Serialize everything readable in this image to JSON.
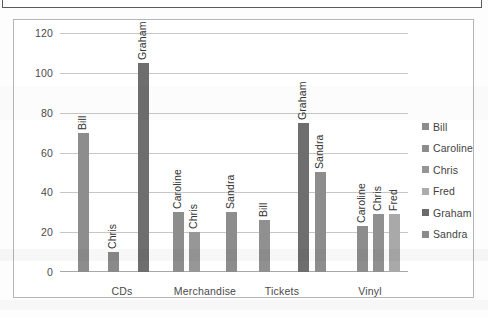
{
  "chart_data": {
    "type": "bar",
    "title": "",
    "subtitle": "",
    "xlabel": "",
    "ylabel": "",
    "ylim": [
      0,
      120
    ],
    "ytick_step": 20,
    "yticks": [
      "120",
      "100",
      "80",
      "60",
      "40",
      "20",
      "0"
    ],
    "grid": true,
    "legend_position": "right",
    "categories": [
      "CDs",
      "Merchandise",
      "Tickets",
      "Vinyl"
    ],
    "legend": [
      "Bill",
      "Caroline",
      "Chris",
      "Fred",
      "Graham",
      "Sandra"
    ],
    "series": [
      {
        "name": "Bill",
        "values": [
          70,
          null,
          null,
          null
        ]
      },
      {
        "name": "Caroline",
        "values": [
          null,
          30,
          null,
          23
        ]
      },
      {
        "name": "Chris",
        "values": [
          10,
          20,
          null,
          29
        ]
      },
      {
        "name": "Fred",
        "values": [
          null,
          null,
          null,
          29
        ]
      },
      {
        "name": "Graham",
        "values": [
          105,
          null,
          75,
          null
        ]
      },
      {
        "name": "Sandra",
        "values": [
          null,
          30,
          50,
          null
        ]
      }
    ],
    "groups": [
      {
        "category": "CDs",
        "bars": [
          {
            "label": "Bill",
            "value": 70,
            "color": "#8d8d8d"
          },
          {
            "label": "Chris",
            "value": 10,
            "color": "#8a8a8a"
          },
          {
            "label": "Graham",
            "value": 105,
            "color": "#707070"
          }
        ]
      },
      {
        "category": "Merchandise",
        "bars": [
          {
            "label": "Caroline",
            "value": 30,
            "color": "#8d8d8d"
          },
          {
            "label": "Chris",
            "value": 20,
            "color": "#989898"
          }
        ]
      },
      {
        "category": "Tickets",
        "bars": [
          {
            "label": "Sandra",
            "value": 26,
            "color": "#8d8d8d"
          },
          {
            "label": "Bill",
            "value": 0,
            "color": "#8d8d8d"
          }
        ]
      },
      {
        "category": "Vinyl",
        "bars": [
          {
            "label": "Caroline",
            "value": 23,
            "color": "#8d8d8d"
          },
          {
            "label": "Chris",
            "value": 29,
            "color": "#909090"
          },
          {
            "label": "Fred",
            "value": 29,
            "color": "#a8a8a8"
          }
        ]
      }
    ],
    "plotted_bars": [
      {
        "label": "Bill",
        "value": 70,
        "color": "#8d8d8d",
        "x": 18,
        "category": "CDs"
      },
      {
        "label": "Chris",
        "value": 10,
        "color": "#8a8a8a",
        "x": 48,
        "category": "CDs"
      },
      {
        "label": "Graham",
        "value": 105,
        "color": "#6e6e6e",
        "x": 78,
        "category": "CDs"
      },
      {
        "label": "Caroline",
        "value": 30,
        "color": "#8d8d8d",
        "x": 113,
        "category": "Merchandise"
      },
      {
        "label": "Chris",
        "value": 20,
        "color": "#979797",
        "x": 129,
        "category": "Merchandise"
      },
      {
        "label": "Sandra",
        "value": 30,
        "color": "#8d8d8d",
        "x": 166,
        "category": "Merchandise"
      },
      {
        "label": "Bill",
        "value": 26,
        "color": "#909090",
        "x": 199,
        "category": "Tickets"
      },
      {
        "label": "Graham",
        "value": 75,
        "color": "#6e6e6e",
        "x": 238,
        "category": "Tickets"
      },
      {
        "label": "Sandra",
        "value": 50,
        "color": "#8d8d8d",
        "x": 255,
        "category": "Tickets"
      },
      {
        "label": "Caroline",
        "value": 23,
        "color": "#8d8d8d",
        "x": 297,
        "category": "Vinyl"
      },
      {
        "label": "Chris",
        "value": 29,
        "color": "#909090",
        "x": 313,
        "category": "Vinyl"
      },
      {
        "label": "Fred",
        "value": 29,
        "color": "#a9a9a9",
        "x": 329,
        "category": "Vinyl"
      }
    ],
    "category_x": [
      62,
      145,
      222,
      310
    ],
    "legend_colors": {
      "Bill": "#8d8d8d",
      "Caroline": "#8d8d8d",
      "Chris": "#959595",
      "Fred": "#ababab",
      "Graham": "#6b6b6b",
      "Sandra": "#8a8a8a"
    },
    "colors": {
      "gridline": "#c7c7c7",
      "axis": "#a8a8a8",
      "text": "#4a4a4a",
      "frame": "#b5b5b5",
      "background": "#ffffff"
    }
  }
}
